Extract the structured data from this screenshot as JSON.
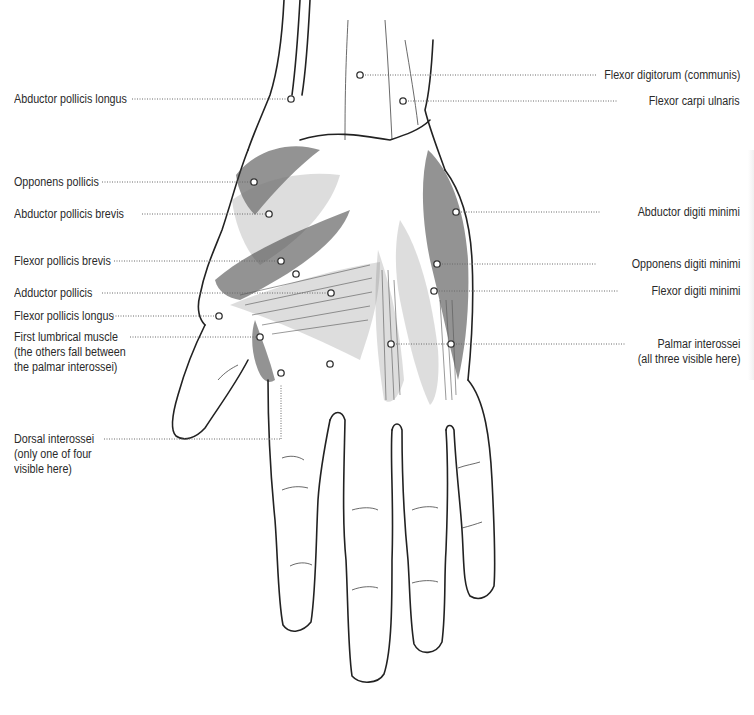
{
  "diagram": {
    "labels_left": [
      {
        "id": "abductor-pollicis-longus",
        "lines": [
          "Abductor pollicis longus"
        ]
      },
      {
        "id": "opponens-pollicis",
        "lines": [
          "Opponens pollicis"
        ]
      },
      {
        "id": "abductor-pollicis-brevis",
        "lines": [
          "Abductor pollicis brevis"
        ]
      },
      {
        "id": "flexor-pollicis-brevis",
        "lines": [
          "Flexor pollicis brevis"
        ]
      },
      {
        "id": "adductor-pollicis",
        "lines": [
          "Adductor pollicis"
        ]
      },
      {
        "id": "flexor-pollicis-longus",
        "lines": [
          "Flexor pollicis longus"
        ]
      },
      {
        "id": "first-lumbrical-muscle",
        "lines": [
          "First lumbrical muscle",
          "(the others fall between",
          "the palmar interossei)"
        ]
      },
      {
        "id": "dorsal-interossei",
        "lines": [
          "Dorsal interossei",
          "(only one of four",
          "visible here)"
        ]
      }
    ],
    "labels_right": [
      {
        "id": "flexor-digitorum-communis",
        "lines": [
          "Flexor digitorum (communis)"
        ]
      },
      {
        "id": "flexor-carpi-ulnaris",
        "lines": [
          "Flexor carpi ulnaris"
        ]
      },
      {
        "id": "abductor-digiti-minimi",
        "lines": [
          "Abductor digiti minimi"
        ]
      },
      {
        "id": "opponens-digiti-minimi",
        "lines": [
          "Opponens digiti minimi"
        ]
      },
      {
        "id": "flexor-digiti-minimi",
        "lines": [
          "Flexor digiti minimi"
        ]
      },
      {
        "id": "palmar-interossei",
        "lines": [
          "Palmar interossei",
          "(all three visible here)"
        ]
      }
    ],
    "colors": {
      "background": "#ffffff",
      "ink": "#2a2a2a",
      "leader": "#6a6a6a"
    }
  }
}
